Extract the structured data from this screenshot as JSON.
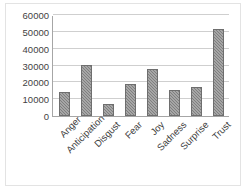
{
  "chart_data": {
    "type": "bar",
    "title": "",
    "subtitle": "",
    "xlabel": "",
    "ylabel": "",
    "categories": [
      "Anger",
      "Anticipation",
      "Disgust",
      "Fear",
      "Joy",
      "Sadness",
      "Surprise",
      "Trust"
    ],
    "values": [
      14500,
      30500,
      7000,
      19000,
      28000,
      15500,
      17500,
      51500
    ],
    "ylim": [
      0,
      60000
    ],
    "yticks": [
      0,
      10000,
      20000,
      30000,
      40000,
      50000,
      60000
    ],
    "ytick_labels": [
      "0",
      "10000",
      "20000",
      "30000",
      "40000",
      "50000",
      "60000"
    ],
    "grid": true,
    "gridlines": "horizontal",
    "legend": false,
    "legend_position": "none",
    "bar_color": "#7f7f7f",
    "bar_pattern": "diagonal-hatch",
    "axis_color": "#a6a6a6",
    "gridline_color": "#cfcfcf",
    "background_color": "#ffffff",
    "xtick_rotation": -45
  }
}
